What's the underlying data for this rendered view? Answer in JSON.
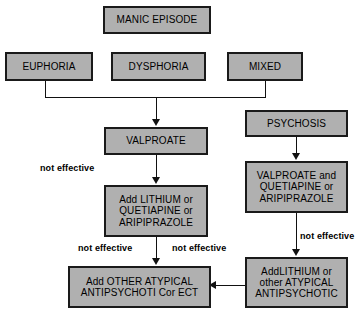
{
  "diagram": {
    "box_fill": "#b0b0b0",
    "box_border": "#1a1a1a",
    "line_color": "#111111",
    "background": "#ffffff"
  },
  "nodes": {
    "manic_episode": {
      "text": "MANIC EPISODE"
    },
    "euphoria": {
      "text": "EUPHORIA"
    },
    "dysphoria": {
      "text": "DYSPHORIA"
    },
    "mixed": {
      "text": "MIXED"
    },
    "valproate": {
      "text": "VALPROATE"
    },
    "psychosis": {
      "text": "PSYCHOSIS"
    },
    "add_lithium_center": {
      "line1": "Add LITHIUM or",
      "line2": "QUETIAPINE or",
      "line3": "ARIPIPRAZOLE"
    },
    "valproate_quetiapine": {
      "line1": "VALPROATE and",
      "line2": "QUETIAPINE or",
      "line3": "ARIPIPRAZOLE"
    },
    "other_atypical": {
      "line1": "Add OTHER ATYPICAL",
      "line2": "ANTIPSYCHOTI Cor ECT"
    },
    "add_lithium_right": {
      "line1": "AddLITHIUM or",
      "line2": "other ATYPICAL",
      "line3": "ANTIPSYCHOTIC"
    }
  },
  "edge_labels": {
    "valproate_not_effective": "not effective",
    "center_left_not_effective": "not effective",
    "center_right_not_effective": "not effective",
    "right_not_effective": "not effective"
  }
}
